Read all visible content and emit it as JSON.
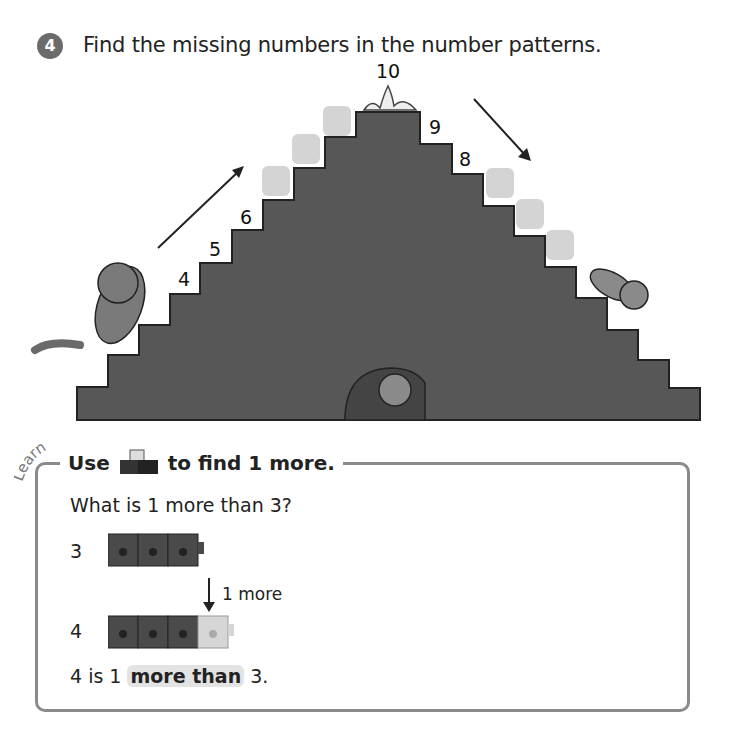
{
  "question": {
    "number": "4",
    "text": "Find the missing numbers in the number patterns."
  },
  "staircase": {
    "labels": {
      "top": "10",
      "left_4": "4",
      "left_5": "5",
      "left_6": "6",
      "right_9": "9",
      "right_8": "8"
    },
    "missing_left_count": 3,
    "missing_right_count": 3,
    "colors": {
      "stair": "#5a5a5a",
      "blank": "#d4d4d4"
    }
  },
  "learn": {
    "tag": "Learn",
    "title_use": "Use",
    "title_rest": "to find 1 more.",
    "question": "What is 1 more than 3?",
    "row1_label": "3",
    "arrow_label": "1 more",
    "row2_label": "4",
    "conclusion_pre": "4 is 1",
    "conclusion_bold": "more than",
    "conclusion_post": "3."
  }
}
